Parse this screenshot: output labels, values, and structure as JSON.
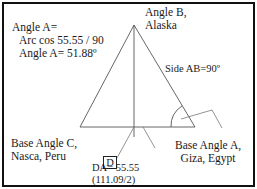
{
  "diagram": {
    "colors": {
      "line": "#555555",
      "frame": "#111111",
      "text": "#1a1a1a",
      "background": "#ffffff"
    },
    "labels": {
      "angle_a_formula": {
        "line1": "Angle A=",
        "line2": "Arc cos 55.55 / 90",
        "line3": "Angle A= 51.88º"
      },
      "vertex_b": {
        "line1": "Angle B,",
        "line2": "Alaska"
      },
      "side_ab": "Side AB=90º",
      "vertex_c": {
        "line1": "Base Angle C,",
        "line2": "Nasca, Peru"
      },
      "vertex_a": {
        "line1": "Base Angle A,",
        "line2": "Giza, Egypt"
      },
      "point_d": "D",
      "da_value": {
        "line1": "DA= 55.55",
        "line2": "(111.09/2)"
      }
    },
    "points": {
      "B": {
        "x": 134,
        "y": 25
      },
      "C": {
        "x": 80,
        "y": 127
      },
      "A": {
        "x": 195,
        "y": 127
      },
      "D": {
        "x": 134,
        "y": 127
      }
    }
  }
}
